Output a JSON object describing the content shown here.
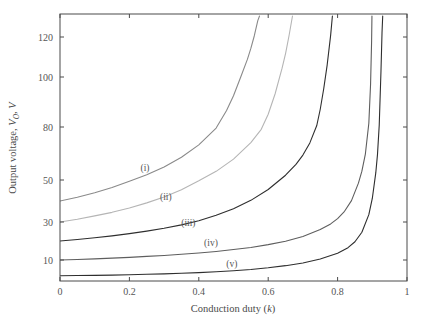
{
  "chart_data": {
    "type": "line",
    "title": "",
    "xlabel": "Conduction duty (k)",
    "ylabel": "Output voltage, V_O, V",
    "ylabel_parts": {
      "prefix": "Output voltage, ",
      "symbol": "V",
      "subscript": "O",
      "suffix": ", V"
    },
    "xlabel_parts": {
      "prefix": "Conduction duty (",
      "symbol": "k",
      "suffix": ")"
    },
    "xlim": [
      0,
      1
    ],
    "ylim": [
      0,
      130
    ],
    "grid": false,
    "legend_position": "inline-annotations",
    "xticks": [
      0,
      0.2,
      0.4,
      0.6,
      0.8,
      1
    ],
    "xtick_labels": [
      "0",
      "0.2",
      "0.4",
      "0.6",
      "0.8",
      "1"
    ],
    "yticks": [
      10,
      30,
      50,
      80,
      100,
      120
    ],
    "ytick_labels": [
      "10",
      "30",
      "50",
      "80",
      "100",
      "120"
    ],
    "y_axis_scale": "nonlinear-piecewise",
    "annotations": [
      {
        "text": "(i)",
        "x": 0.245,
        "y": 57
      },
      {
        "text": "(ii)",
        "x": 0.305,
        "y": 42
      },
      {
        "text": "(iii)",
        "x": 0.37,
        "y": 30
      },
      {
        "text": "(iv)",
        "x": 0.435,
        "y": 19
      },
      {
        "text": "(v)",
        "x": 0.495,
        "y": 8.5
      }
    ],
    "series": [
      {
        "name": "(i)",
        "color": "#8a8a8a",
        "asymptote_k": 0.585,
        "v0": 40,
        "points": [
          [
            0.0,
            40.0
          ],
          [
            0.05,
            41.8
          ],
          [
            0.1,
            43.9
          ],
          [
            0.15,
            46.4
          ],
          [
            0.2,
            49.4
          ],
          [
            0.25,
            53.0
          ],
          [
            0.3,
            57.4
          ],
          [
            0.35,
            62.9
          ],
          [
            0.4,
            69.9
          ],
          [
            0.45,
            79.4
          ],
          [
            0.48,
            86.6
          ],
          [
            0.5,
            92.5
          ],
          [
            0.52,
            99.7
          ],
          [
            0.54,
            108.8
          ],
          [
            0.55,
            114.3
          ],
          [
            0.56,
            120.6
          ],
          [
            0.57,
            127.8
          ],
          [
            0.575,
            131.9
          ]
        ]
      },
      {
        "name": "(ii)",
        "color": "#b5b5b5",
        "asymptote_k": 0.682,
        "v0": 30,
        "points": [
          [
            0.0,
            30.0
          ],
          [
            0.05,
            31.3
          ],
          [
            0.1,
            32.9
          ],
          [
            0.15,
            34.6
          ],
          [
            0.2,
            36.7
          ],
          [
            0.25,
            39.1
          ],
          [
            0.3,
            41.9
          ],
          [
            0.35,
            45.4
          ],
          [
            0.4,
            49.6
          ],
          [
            0.45,
            54.9
          ],
          [
            0.5,
            61.8
          ],
          [
            0.55,
            71.2
          ],
          [
            0.58,
            78.7
          ],
          [
            0.6,
            85.1
          ],
          [
            0.62,
            93.3
          ],
          [
            0.64,
            104.4
          ],
          [
            0.65,
            111.7
          ],
          [
            0.66,
            120.6
          ],
          [
            0.67,
            131.5
          ]
        ]
      },
      {
        "name": "(iii)",
        "color": "#2e2e2e",
        "asymptote_k": 0.787,
        "v0": 20,
        "points": [
          [
            0.0,
            20.0
          ],
          [
            0.05,
            20.8
          ],
          [
            0.1,
            21.7
          ],
          [
            0.15,
            22.7
          ],
          [
            0.2,
            23.9
          ],
          [
            0.25,
            25.2
          ],
          [
            0.3,
            26.7
          ],
          [
            0.35,
            28.5
          ],
          [
            0.4,
            30.6
          ],
          [
            0.45,
            33.2
          ],
          [
            0.5,
            36.3
          ],
          [
            0.55,
            40.3
          ],
          [
            0.6,
            45.5
          ],
          [
            0.65,
            52.7
          ],
          [
            0.68,
            58.8
          ],
          [
            0.7,
            64.1
          ],
          [
            0.72,
            71.0
          ],
          [
            0.74,
            80.6
          ],
          [
            0.75,
            87.1
          ],
          [
            0.76,
            95.3
          ],
          [
            0.77,
            106.1
          ],
          [
            0.78,
            120.9
          ],
          [
            0.785,
            131.3
          ]
        ]
      },
      {
        "name": "(iv)",
        "color": "#5e5e5e",
        "asymptote_k": 0.898,
        "v0": 10,
        "points": [
          [
            0.0,
            10.0
          ],
          [
            0.05,
            10.3
          ],
          [
            0.1,
            10.6
          ],
          [
            0.15,
            11.0
          ],
          [
            0.2,
            11.4
          ],
          [
            0.25,
            11.9
          ],
          [
            0.3,
            12.4
          ],
          [
            0.35,
            13.0
          ],
          [
            0.4,
            13.7
          ],
          [
            0.45,
            14.5
          ],
          [
            0.5,
            15.5
          ],
          [
            0.55,
            16.6
          ],
          [
            0.6,
            18.1
          ],
          [
            0.65,
            19.9
          ],
          [
            0.7,
            22.4
          ],
          [
            0.75,
            26.0
          ],
          [
            0.78,
            29.0
          ],
          [
            0.8,
            31.6
          ],
          [
            0.82,
            35.1
          ],
          [
            0.84,
            40.2
          ],
          [
            0.86,
            48.5
          ],
          [
            0.87,
            55.0
          ],
          [
            0.88,
            64.7
          ],
          [
            0.89,
            81.5
          ],
          [
            0.895,
            97.0
          ],
          [
            0.898,
            118.0
          ],
          [
            0.899,
            131.0
          ]
        ]
      },
      {
        "name": "(v)",
        "color": "#2e2e2e",
        "asymptote_k": 0.932,
        "v0": 2.5,
        "points": [
          [
            0.0,
            2.5
          ],
          [
            0.05,
            2.6
          ],
          [
            0.1,
            2.7
          ],
          [
            0.15,
            2.8
          ],
          [
            0.2,
            3.0
          ],
          [
            0.25,
            3.2
          ],
          [
            0.3,
            3.4
          ],
          [
            0.35,
            3.7
          ],
          [
            0.4,
            4.0
          ],
          [
            0.45,
            4.4
          ],
          [
            0.5,
            4.9
          ],
          [
            0.55,
            5.5
          ],
          [
            0.6,
            6.3
          ],
          [
            0.65,
            7.3
          ],
          [
            0.7,
            8.6
          ],
          [
            0.75,
            10.5
          ],
          [
            0.8,
            13.5
          ],
          [
            0.83,
            16.5
          ],
          [
            0.85,
            19.6
          ],
          [
            0.87,
            24.6
          ],
          [
            0.89,
            33.5
          ],
          [
            0.9,
            41.2
          ],
          [
            0.91,
            54.0
          ],
          [
            0.915,
            64.5
          ],
          [
            0.92,
            80.8
          ],
          [
            0.925,
            103.0
          ],
          [
            0.928,
            122.0
          ],
          [
            0.93,
            133.0
          ]
        ]
      }
    ]
  }
}
